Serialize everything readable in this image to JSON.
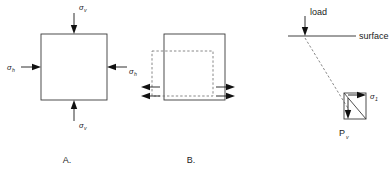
{
  "figure": {
    "background_color": "#ffffff",
    "line_color": "#2a2a2a",
    "dashed_color": "#6a6a6a",
    "panels": [
      {
        "id": "A",
        "caption": "A.",
        "description": "Soil element under vertical and horizontal normal stresses",
        "labels": {
          "top": {
            "symbol": "σ",
            "subscript": "v"
          },
          "bottom": {
            "symbol": "σ",
            "subscript": "v"
          },
          "left": {
            "symbol": "σ",
            "subscript": "h"
          },
          "right": {
            "symbol": "σ",
            "subscript": "h"
          }
        }
      },
      {
        "id": "B",
        "caption": "B.",
        "description": "Soil element under shear distortion showing original dashed outline",
        "labels": {}
      },
      {
        "id": "C",
        "caption": "",
        "description": "Point load at ground surface with stress at depth",
        "labels": {
          "load": "load",
          "surface": "surface",
          "principal_stress": {
            "symbol": "σ",
            "subscript": "1"
          },
          "vertical_pressure": {
            "symbol": "P",
            "subscript": "v"
          }
        }
      }
    ]
  }
}
